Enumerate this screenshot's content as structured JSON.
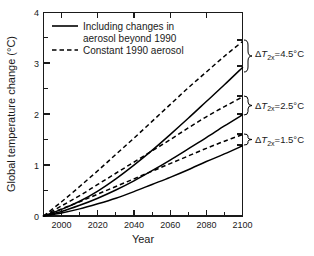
{
  "chart_data": {
    "type": "line",
    "title": "",
    "xlabel": "Year",
    "ylabel": "Global temperature change (°C)",
    "xlim": [
      1990,
      2100
    ],
    "ylim": [
      0,
      4
    ],
    "xticks": [
      2000,
      2020,
      2040,
      2060,
      2080,
      2100
    ],
    "xtick_labels": [
      "2000",
      "2020",
      "2040",
      "2060",
      "2080",
      "2100"
    ],
    "yticks": [
      0,
      1,
      2,
      3,
      4
    ],
    "ytick_labels": [
      "0",
      "1",
      "2",
      "3",
      "4"
    ],
    "yticks_minor": [
      0.5,
      1.5,
      2.5,
      3.5
    ],
    "xticks_minor": [
      1990,
      2010,
      2030,
      2050,
      2070,
      2090
    ],
    "grid": false,
    "legend_position": "upper-left-inside",
    "legend": [
      {
        "label": "Including changes in aerosol beyond 1990",
        "style": "solid"
      },
      {
        "label": "Constant 1990 aerosol",
        "style": "dashed"
      }
    ],
    "x": [
      1990,
      2000,
      2010,
      2020,
      2030,
      2040,
      2050,
      2060,
      2070,
      2080,
      2090,
      2100
    ],
    "series": [
      {
        "name": "ΔT2x=4.5°C, constant 1990 aerosol",
        "style": "dashed",
        "sensitivity": "4.5",
        "values": [
          0.0,
          0.28,
          0.58,
          0.89,
          1.21,
          1.53,
          1.86,
          2.19,
          2.52,
          2.83,
          3.14,
          3.43
        ]
      },
      {
        "name": "ΔT2x=4.5°C, including aerosol changes",
        "style": "solid",
        "sensitivity": "4.5",
        "values": [
          0.0,
          0.13,
          0.29,
          0.49,
          0.73,
          1.0,
          1.29,
          1.6,
          1.92,
          2.25,
          2.58,
          2.92
        ]
      },
      {
        "name": "ΔT2x=2.5°C, constant 1990 aerosol",
        "style": "dashed",
        "sensitivity": "2.5",
        "values": [
          0.0,
          0.2,
          0.4,
          0.62,
          0.84,
          1.06,
          1.28,
          1.5,
          1.73,
          1.95,
          2.15,
          2.34
        ]
      },
      {
        "name": "ΔT2x=2.5°C, including aerosol changes",
        "style": "solid",
        "sensitivity": "2.5",
        "values": [
          0.0,
          0.09,
          0.21,
          0.35,
          0.51,
          0.69,
          0.89,
          1.1,
          1.32,
          1.54,
          1.77,
          1.99
        ]
      },
      {
        "name": "ΔT2x=1.5°C, constant 1990 aerosol",
        "style": "dashed",
        "sensitivity": "1.5",
        "values": [
          0.0,
          0.14,
          0.28,
          0.43,
          0.58,
          0.73,
          0.88,
          1.03,
          1.18,
          1.33,
          1.47,
          1.6
        ]
      },
      {
        "name": "ΔT2x=1.5°C, including aerosol changes",
        "style": "solid",
        "sensitivity": "1.5",
        "values": [
          0.0,
          0.06,
          0.14,
          0.24,
          0.35,
          0.48,
          0.62,
          0.76,
          0.91,
          1.07,
          1.22,
          1.38
        ]
      }
    ],
    "annotations": [
      {
        "symbol": "Δ",
        "italic": "T",
        "sub": "2x",
        "text": "=4.5°C",
        "y_center": 3.18,
        "y_top": 3.43,
        "y_bottom": 2.92
      },
      {
        "symbol": "Δ",
        "italic": "T",
        "sub": "2x",
        "text": "=2.5°C",
        "y_center": 2.17,
        "y_top": 2.34,
        "y_bottom": 1.99
      },
      {
        "symbol": "Δ",
        "italic": "T",
        "sub": "2x",
        "text": "=1.5°C",
        "y_center": 1.49,
        "y_top": 1.6,
        "y_bottom": 1.38
      }
    ]
  },
  "colors": {
    "background": "#ffffff",
    "axis": "#1a1a1a",
    "curve": "#000000",
    "text": "#1a1a1a"
  }
}
